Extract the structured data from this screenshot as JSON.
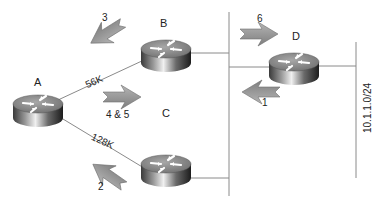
{
  "diagram": {
    "type": "network-topology",
    "routers": [
      {
        "id": "A",
        "label": "A"
      },
      {
        "id": "B",
        "label": "B"
      },
      {
        "id": "C",
        "label": "C"
      },
      {
        "id": "D",
        "label": "D"
      }
    ],
    "links": [
      {
        "from": "A",
        "to": "B",
        "label": "56K"
      },
      {
        "from": "A",
        "to": "C",
        "label": "128K"
      },
      {
        "from": "B",
        "to": "shared-segment",
        "label": ""
      },
      {
        "from": "C",
        "to": "shared-segment",
        "label": ""
      },
      {
        "from": "D",
        "to": "shared-segment",
        "label": ""
      },
      {
        "from": "D",
        "to": "subnet",
        "label": ""
      }
    ],
    "subnet_label": "10.1.1.0/24",
    "steps": [
      {
        "number": "1",
        "label": "1",
        "direction": "left"
      },
      {
        "number": "2",
        "label": "2",
        "direction": "up-left"
      },
      {
        "number": "3",
        "label": "3",
        "direction": "down-left"
      },
      {
        "number": "4 & 5",
        "label": "4 & 5",
        "direction": "right"
      },
      {
        "number": "6",
        "label": "6",
        "direction": "right"
      }
    ],
    "colors": {
      "line": "#8a8a8a",
      "arrow_fill": "#9a9a9a",
      "arrow_stroke": "#6e6e6e",
      "router_top": "#8c8c8c",
      "router_side_dark": "#2a2a2a",
      "router_side_light": "#e8e8e8",
      "text": "#222222"
    }
  }
}
